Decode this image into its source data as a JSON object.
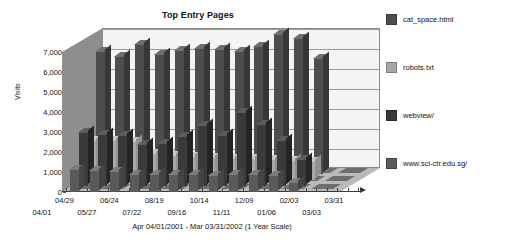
{
  "chart_data": {
    "type": "bar",
    "title": "Top Entry Pages",
    "subtitle": "Apr 04/01/2001 - Mar 03/31/2002 (1 Year Scale)",
    "xlabel": "",
    "ylabel": "Visits",
    "ylim": [
      0,
      7000
    ],
    "ytick_labels": [
      "0",
      "1,000",
      "2,000",
      "3,000",
      "4,000",
      "5,000",
      "6,000",
      "7,000"
    ],
    "ytick_values": [
      0,
      1000,
      2000,
      3000,
      4000,
      5000,
      6000,
      7000
    ],
    "grid": true,
    "legend_position": "right",
    "style": "3d-grouped-bar",
    "categories": [
      "04/01",
      "04/29",
      "05/27",
      "06/24",
      "07/22",
      "08/19",
      "09/16",
      "10/14",
      "11/11",
      "12/09",
      "01/06",
      "02/03",
      "03/03",
      "03/31"
    ],
    "xtick_labels_row_top": [
      "04/29",
      "06/24",
      "08/19",
      "10/14",
      "12/09",
      "02/03",
      "03/31"
    ],
    "xtick_labels_row_bottom": [
      "04/01",
      "05/27",
      "07/22",
      "09/16",
      "11/11",
      "01/06",
      "03/03"
    ],
    "series": [
      {
        "name": "cat_space.html",
        "color": "#4d4d4d",
        "values": [
          6150,
          5900,
          6500,
          6000,
          6200,
          6300,
          6250,
          6150,
          6400,
          7000,
          6800,
          5800,
          0,
          0
        ]
      },
      {
        "name": "robots.txt",
        "color": "#a8a8a8",
        "values": [
          2000,
          2000,
          1950,
          1350,
          1250,
          1200,
          1150,
          1100,
          1100,
          1050,
          1000,
          950,
          0,
          0
        ]
      },
      {
        "name": "webview/",
        "color": "#3a3a3a",
        "values": [
          2700,
          2600,
          2550,
          2100,
          2150,
          2500,
          3050,
          2550,
          3700,
          3100,
          2300,
          1350,
          0,
          0
        ]
      },
      {
        "name": "www.sci-ctr.edu.sg/",
        "color": "#5a5a5a",
        "values": [
          1150,
          1100,
          1050,
          900,
          900,
          880,
          900,
          860,
          900,
          880,
          850,
          520,
          0,
          0
        ]
      }
    ]
  },
  "legend": {
    "items": [
      {
        "label": "cat_space.html",
        "color": "#4d4d4d"
      },
      {
        "label": "robots.txt",
        "color": "#a8a8a8"
      },
      {
        "label": "webview/",
        "color": "#3a3a3a"
      },
      {
        "label": "www.sci-ctr.edu.sg/",
        "color": "#5a5a5a"
      }
    ]
  },
  "colors": {
    "plot_background": "#f4f4f4",
    "left_wall": "#8e8e8e",
    "floor": "#b9b9b9",
    "floor_tile": "#6e6e6e",
    "gridline": "#9a9a9a",
    "axis": "#3a3a3a",
    "text": "#111111",
    "page_background": "#ffffff"
  }
}
